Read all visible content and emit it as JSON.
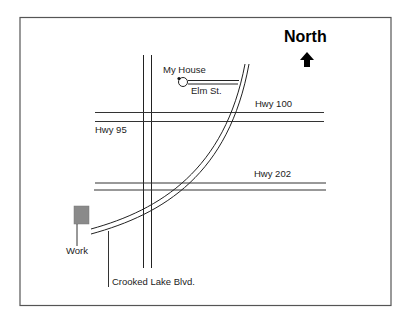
{
  "map": {
    "compass": {
      "label": "North",
      "icon": "north-arrow-icon"
    },
    "landmarks": {
      "home": {
        "label": "My House"
      },
      "work": {
        "label": "Work",
        "fill": "#8a8a8a"
      }
    },
    "roads": [
      {
        "id": "elm-st",
        "label": "Elm St."
      },
      {
        "id": "hwy-100",
        "label": "Hwy 100"
      },
      {
        "id": "hwy-95",
        "label": "Hwy 95"
      },
      {
        "id": "hwy-202",
        "label": "Hwy 202"
      },
      {
        "id": "crooked-lake-blvd",
        "label": "Crooked Lake Blvd."
      }
    ],
    "colors": {
      "line": "#222222",
      "border": "#555555",
      "background": "#ffffff"
    }
  }
}
